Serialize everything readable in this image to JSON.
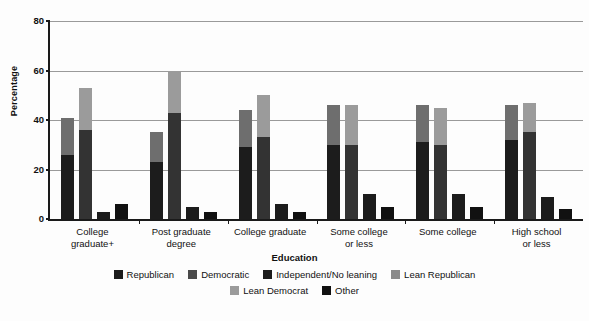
{
  "chart_data": {
    "type": "bar",
    "title": "",
    "xlabel": "Education",
    "ylabel": "Percentage",
    "ylim": [
      0,
      80
    ],
    "yticks": [
      0,
      20,
      40,
      60,
      80
    ],
    "grid": true,
    "legend_position": "bottom",
    "stacked": true,
    "categories": [
      "College graduate+",
      "Post graduate degree",
      "College graduate",
      "Some college or less",
      "Some college",
      "High school or less"
    ],
    "category_lines": [
      [
        "College",
        "graduate+"
      ],
      [
        "Post graduate",
        "degree"
      ],
      [
        "College graduate",
        ""
      ],
      [
        "Some college",
        "or less"
      ],
      [
        "Some college",
        ""
      ],
      [
        "High school",
        "or less"
      ]
    ],
    "series": [
      {
        "name": "Republican",
        "color": "#1c1c1c",
        "column": 0,
        "values": [
          26,
          23,
          29,
          30,
          31,
          32
        ]
      },
      {
        "name": "Lean Republican",
        "color": "#6e6e6e",
        "column": 0,
        "values": [
          15,
          12,
          15,
          16,
          15,
          14
        ]
      },
      {
        "name": "Democratic",
        "color": "#333333",
        "column": 1,
        "values": [
          36,
          43,
          33,
          30,
          30,
          35
        ]
      },
      {
        "name": "Lean Democrat",
        "color": "#9b9b9b",
        "column": 1,
        "values": [
          17,
          17,
          17,
          16,
          15,
          12
        ]
      },
      {
        "name": "Independent/No leaning",
        "color": "#1c1c1c",
        "column": 2,
        "values": [
          3,
          5,
          6,
          10,
          10,
          9
        ]
      },
      {
        "name": "Other",
        "color": "#111111",
        "column": 3,
        "values": [
          6,
          3,
          3,
          5,
          5,
          4
        ]
      }
    ],
    "column_totals": {
      "republican_stack": [
        41,
        35,
        44,
        46,
        46,
        46
      ],
      "democrat_stack": [
        53,
        60,
        50,
        46,
        45,
        47
      ]
    }
  },
  "legend": {
    "row1": [
      {
        "label": "Republican",
        "color": "#1c1c1c"
      },
      {
        "label": "Democratic",
        "color": "#4a4a4a"
      },
      {
        "label": "Independent/No leaning",
        "color": "#1c1c1c"
      },
      {
        "label": "Lean Republican",
        "color": "#8a8a8a"
      }
    ],
    "row2": [
      {
        "label": "Lean Democrat",
        "color": "#9b9b9b"
      },
      {
        "label": "Other",
        "color": "#111111"
      }
    ]
  }
}
